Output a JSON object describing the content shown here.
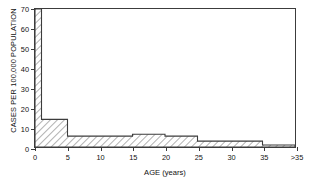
{
  "chart_data": {
    "type": "bar",
    "title": "",
    "subtitle": "",
    "xlabel": "AGE (years)",
    "ylabel": "CASES PER 100,000 POPULATION",
    "xlim": [
      0,
      40
    ],
    "ylim": [
      0,
      70
    ],
    "grid": false,
    "legend": null,
    "style": {
      "fill_pattern": "diagonal-hatch",
      "line_color": "#3c3c3c",
      "hatch_color": "#8c8c8c",
      "background": "#ffffff"
    },
    "xticks": [
      {
        "value": 0,
        "label": "0"
      },
      {
        "value": 5,
        "label": "5"
      },
      {
        "value": 10,
        "label": "10"
      },
      {
        "value": 15,
        "label": "15"
      },
      {
        "value": 20,
        "label": "20"
      },
      {
        "value": 25,
        "label": "25"
      },
      {
        "value": 30,
        "label": "30"
      },
      {
        "value": 35,
        "label": "35"
      },
      {
        "value": 40,
        "label": ">35"
      }
    ],
    "yticks": [
      {
        "value": 0,
        "label": "0"
      },
      {
        "value": 10,
        "label": "10"
      },
      {
        "value": 20,
        "label": "20"
      },
      {
        "value": 30,
        "label": "30"
      },
      {
        "value": 40,
        "label": "40"
      },
      {
        "value": 50,
        "label": "50"
      },
      {
        "value": 60,
        "label": "60"
      },
      {
        "value": 70,
        "label": "70"
      }
    ],
    "categories": [
      "0-1",
      "1-5",
      "5-15",
      "15-20",
      "20-25",
      "25-35",
      ">35"
    ],
    "bins": [
      {
        "label": "0-1",
        "x0": 0,
        "x1": 1,
        "value": 70
      },
      {
        "label": "1-5",
        "x0": 1,
        "x1": 5,
        "value": 14
      },
      {
        "label": "5-15",
        "x0": 5,
        "x1": 15,
        "value": 5.5
      },
      {
        "label": "15-20",
        "x0": 15,
        "x1": 20,
        "value": 6.5
      },
      {
        "label": "20-25",
        "x0": 20,
        "x1": 25,
        "value": 5.5
      },
      {
        "label": "25-35",
        "x0": 25,
        "x1": 35,
        "value": 3
      },
      {
        "label": ">35",
        "x0": 35,
        "x1": 40,
        "value": 1
      }
    ],
    "values": [
      70,
      14,
      5.5,
      6.5,
      5.5,
      3,
      1
    ]
  }
}
